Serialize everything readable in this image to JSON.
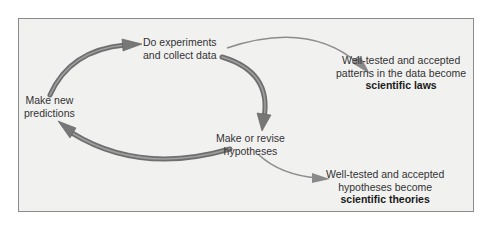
{
  "diagram": {
    "type": "cycle-flow",
    "colors": {
      "background": "#f1f1f0",
      "border": "#8a8a8a",
      "cycle_arrow": "#7a7a7a",
      "branch_arrow": "#8c8c8c",
      "text": "#333333"
    },
    "cycle_nodes": [
      {
        "id": "experiments",
        "lines": [
          "Do experiments",
          "and collect data"
        ]
      },
      {
        "id": "hypotheses",
        "lines": [
          "Make or revise",
          "hypotheses"
        ]
      },
      {
        "id": "predictions",
        "lines": [
          "Make new",
          "predictions"
        ]
      }
    ],
    "outcomes": [
      {
        "id": "laws",
        "from": "experiments",
        "lines": [
          "Well-tested and accepted",
          "patterns in the data become"
        ],
        "bold": "scientific laws"
      },
      {
        "id": "theories",
        "from": "hypotheses",
        "lines": [
          "Well-tested and accepted",
          "hypotheses become"
        ],
        "bold": "scientific theories"
      }
    ],
    "edges": [
      {
        "from": "predictions",
        "to": "experiments",
        "style": "thick"
      },
      {
        "from": "experiments",
        "to": "hypotheses",
        "style": "thick"
      },
      {
        "from": "hypotheses",
        "to": "predictions",
        "style": "thick"
      },
      {
        "from": "experiments",
        "to": "laws",
        "style": "thin"
      },
      {
        "from": "hypotheses",
        "to": "theories",
        "style": "thin"
      }
    ]
  }
}
